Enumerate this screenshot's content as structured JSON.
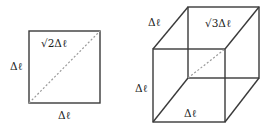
{
  "figure": {
    "square": {
      "label_left": "Δℓ",
      "label_bottom": "Δℓ",
      "label_diagonal": "√2Δℓ"
    },
    "cube": {
      "label_top_left": "Δℓ",
      "label_diagonal": "√3Δℓ",
      "label_left": "Δℓ",
      "label_bottom": "Δℓ"
    },
    "colors": {
      "edge": "#3a3a3a",
      "diagonal": "#9a9a9a",
      "background": "#ffffff"
    }
  }
}
